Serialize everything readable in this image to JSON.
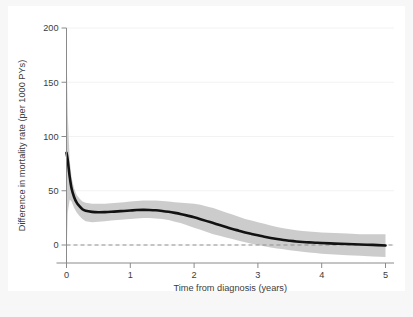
{
  "chart_data": {
    "type": "line",
    "title": "",
    "subtitle": "",
    "xlabel": "Time from diagnosis (years)",
    "ylabel": "Difference in mortality rate (per 1000 PYs)",
    "xlim": [
      0,
      5
    ],
    "ylim": [
      0,
      200
    ],
    "xticks": [
      0,
      1,
      2,
      3,
      4
    ],
    "xticks_all": [
      0,
      1,
      2,
      3,
      4,
      5
    ],
    "yticks": [
      0,
      50,
      100,
      150,
      200
    ],
    "xtick_labels": [
      "0",
      "1",
      "2",
      "3",
      "4",
      "5"
    ],
    "ytick_labels": [
      "0",
      "50",
      "100",
      "150",
      "200"
    ],
    "grid": "faint-horizontal",
    "legend": "none",
    "reference_line": {
      "name": "zero-reference",
      "y": 0,
      "style": "dashed",
      "color": "#8c8c8c"
    },
    "colors": {
      "line": "#121212",
      "band": "#c8c8c8",
      "axis": "#8a8a8a",
      "text": "#3c3c3c",
      "grid": "#f2f2f2",
      "plot_background": "#ffffff",
      "figure_background": "#f7f7f7"
    },
    "series": [
      {
        "name": "Difference in mortality rate",
        "type": "line",
        "x": [
          0.0,
          0.02,
          0.05,
          0.08,
          0.12,
          0.16,
          0.2,
          0.25,
          0.3,
          0.4,
          0.5,
          0.6,
          0.7,
          0.8,
          0.9,
          1.0,
          1.1,
          1.2,
          1.3,
          1.4,
          1.5,
          1.6,
          1.7,
          1.8,
          1.9,
          2.0,
          2.1,
          2.2,
          2.3,
          2.4,
          2.5,
          2.6,
          2.7,
          2.8,
          2.9,
          3.0,
          3.1,
          3.2,
          3.3,
          3.4,
          3.5,
          3.6,
          3.7,
          3.8,
          3.9,
          4.0,
          4.2,
          4.4,
          4.6,
          4.8,
          5.0
        ],
        "y": [
          85,
          78,
          63,
          52,
          44,
          39,
          36,
          33,
          31.5,
          30.5,
          30.2,
          30.3,
          30.6,
          31.0,
          31.4,
          31.8,
          32.2,
          32.4,
          32.3,
          32.0,
          31.4,
          30.6,
          29.6,
          28.4,
          27.0,
          25.5,
          23.8,
          22.0,
          20.2,
          18.4,
          16.6,
          14.8,
          13.2,
          11.6,
          10.2,
          8.9,
          7.6,
          6.5,
          5.5,
          4.6,
          3.9,
          3.3,
          2.8,
          2.4,
          2.1,
          1.8,
          1.3,
          0.9,
          0.5,
          0.1,
          -0.4
        ]
      }
    ],
    "confidence_band": {
      "name": "95% confidence interval",
      "x": [
        0.0,
        0.02,
        0.05,
        0.08,
        0.12,
        0.16,
        0.2,
        0.25,
        0.3,
        0.4,
        0.5,
        0.6,
        0.7,
        0.8,
        0.9,
        1.0,
        1.1,
        1.2,
        1.3,
        1.4,
        1.5,
        1.6,
        1.7,
        1.8,
        1.9,
        2.0,
        2.1,
        2.2,
        2.3,
        2.4,
        2.5,
        2.6,
        2.7,
        2.8,
        2.9,
        3.0,
        3.1,
        3.2,
        3.3,
        3.4,
        3.5,
        3.6,
        3.7,
        3.8,
        3.9,
        4.0,
        4.2,
        4.4,
        4.6,
        4.8,
        5.0
      ],
      "upper": [
        183,
        120,
        78,
        62,
        52,
        46,
        43,
        40,
        39,
        38,
        38,
        38,
        38.5,
        39,
        39.5,
        40,
        40.5,
        41,
        41,
        41,
        40.5,
        40,
        39.5,
        39,
        38.5,
        38,
        37,
        35.5,
        34,
        32,
        30,
        28,
        26,
        24,
        22.5,
        21,
        19.5,
        18,
        16.5,
        15.5,
        14.5,
        13.5,
        13,
        12.5,
        12,
        11.5,
        11,
        10.5,
        10,
        10,
        10
      ],
      "lower": [
        -10,
        30,
        42,
        40,
        34,
        30,
        27,
        24,
        22,
        21,
        21.5,
        22,
        22.5,
        23,
        23.5,
        24,
        24.5,
        24.8,
        24.8,
        24.5,
        24,
        23,
        21.5,
        20,
        18,
        16,
        14,
        12,
        10,
        8.5,
        7,
        5.5,
        4,
        2.5,
        1.2,
        0,
        -1.2,
        -2.2,
        -3.2,
        -4,
        -4.8,
        -5.5,
        -6.2,
        -6.8,
        -7.4,
        -8,
        -8.8,
        -9.4,
        -10,
        -10.5,
        -11
      ]
    },
    "annotations": [
      {
        "name": "initial-spike",
        "text": "peak at diagnosis",
        "x": 0.0,
        "y": 85
      },
      {
        "name": "plateau",
        "text": "plateau",
        "x": 1.2,
        "y": 32.4
      },
      {
        "name": "crossing-zero",
        "text": "approaches zero",
        "x": 5.0,
        "y": -0.4
      }
    ]
  }
}
